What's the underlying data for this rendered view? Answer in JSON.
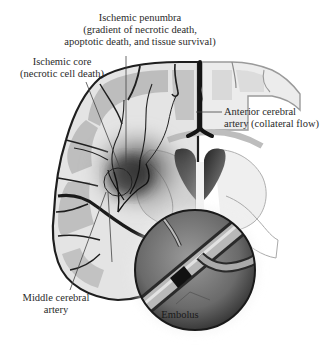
{
  "figure": {
    "type": "medical-illustration"
  },
  "labels": {
    "penumbra": {
      "line1": "Ischemic penumbra",
      "line2": "(gradient of necrotic death,",
      "line3": "apoptotic death, and tissue survival)"
    },
    "core": {
      "line1": "Ischemic core",
      "line2": "(necrotic cell death)"
    },
    "anterior": {
      "line1": "Anterior cerebral",
      "line2": "artery (collateral flow)"
    },
    "middle": {
      "line1": "Middle cerebral",
      "line2": "artery"
    },
    "embolus": "Embolus"
  },
  "colors": {
    "background": "#ffffff",
    "gray_matter": "#b9b9b9",
    "white_matter": "#e6e6e6",
    "vessel": "#1e1e1e",
    "ischemia": "#3a3a3a",
    "text": "#2a2a2a"
  }
}
